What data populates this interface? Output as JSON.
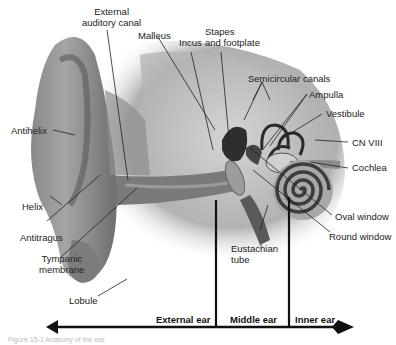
{
  "diagram": {
    "subject": "Anatomy of the ear",
    "labels": [
      {
        "id": "external-auditory-canal",
        "text": [
          "External",
          "auditory canal"
        ]
      },
      {
        "id": "malleus",
        "text": [
          "Malleus"
        ]
      },
      {
        "id": "incus",
        "text": [
          "Incus"
        ]
      },
      {
        "id": "stapes",
        "text": [
          "Stapes",
          "and footplate"
        ]
      },
      {
        "id": "semicircular-canals",
        "text": [
          "Semicircular canals"
        ]
      },
      {
        "id": "ampulla",
        "text": [
          "Ampulla"
        ]
      },
      {
        "id": "vestibule",
        "text": [
          "Vestibule"
        ]
      },
      {
        "id": "cn-viii",
        "text": [
          "CN VIII"
        ]
      },
      {
        "id": "cochlea",
        "text": [
          "Cochlea"
        ]
      },
      {
        "id": "oval-window",
        "text": [
          "Oval window"
        ]
      },
      {
        "id": "round-window",
        "text": [
          "Round window"
        ]
      },
      {
        "id": "eustachian-tube",
        "text": [
          "Eustachian",
          "tube"
        ]
      },
      {
        "id": "antihelix",
        "text": [
          "Antihelix"
        ]
      },
      {
        "id": "helix",
        "text": [
          "Helix"
        ]
      },
      {
        "id": "antitragus",
        "text": [
          "Antitragus"
        ]
      },
      {
        "id": "tympanic-membrane",
        "text": [
          "Tympanic",
          "membrane"
        ]
      },
      {
        "id": "lobule",
        "text": [
          "Lobule"
        ]
      }
    ],
    "regions": [
      {
        "id": "external-ear",
        "text": "External ear"
      },
      {
        "id": "middle-ear",
        "text": "Middle ear"
      },
      {
        "id": "inner-ear",
        "text": "Inner ear"
      }
    ],
    "caption": "Figure 15-1  Anatomy of the ear."
  }
}
